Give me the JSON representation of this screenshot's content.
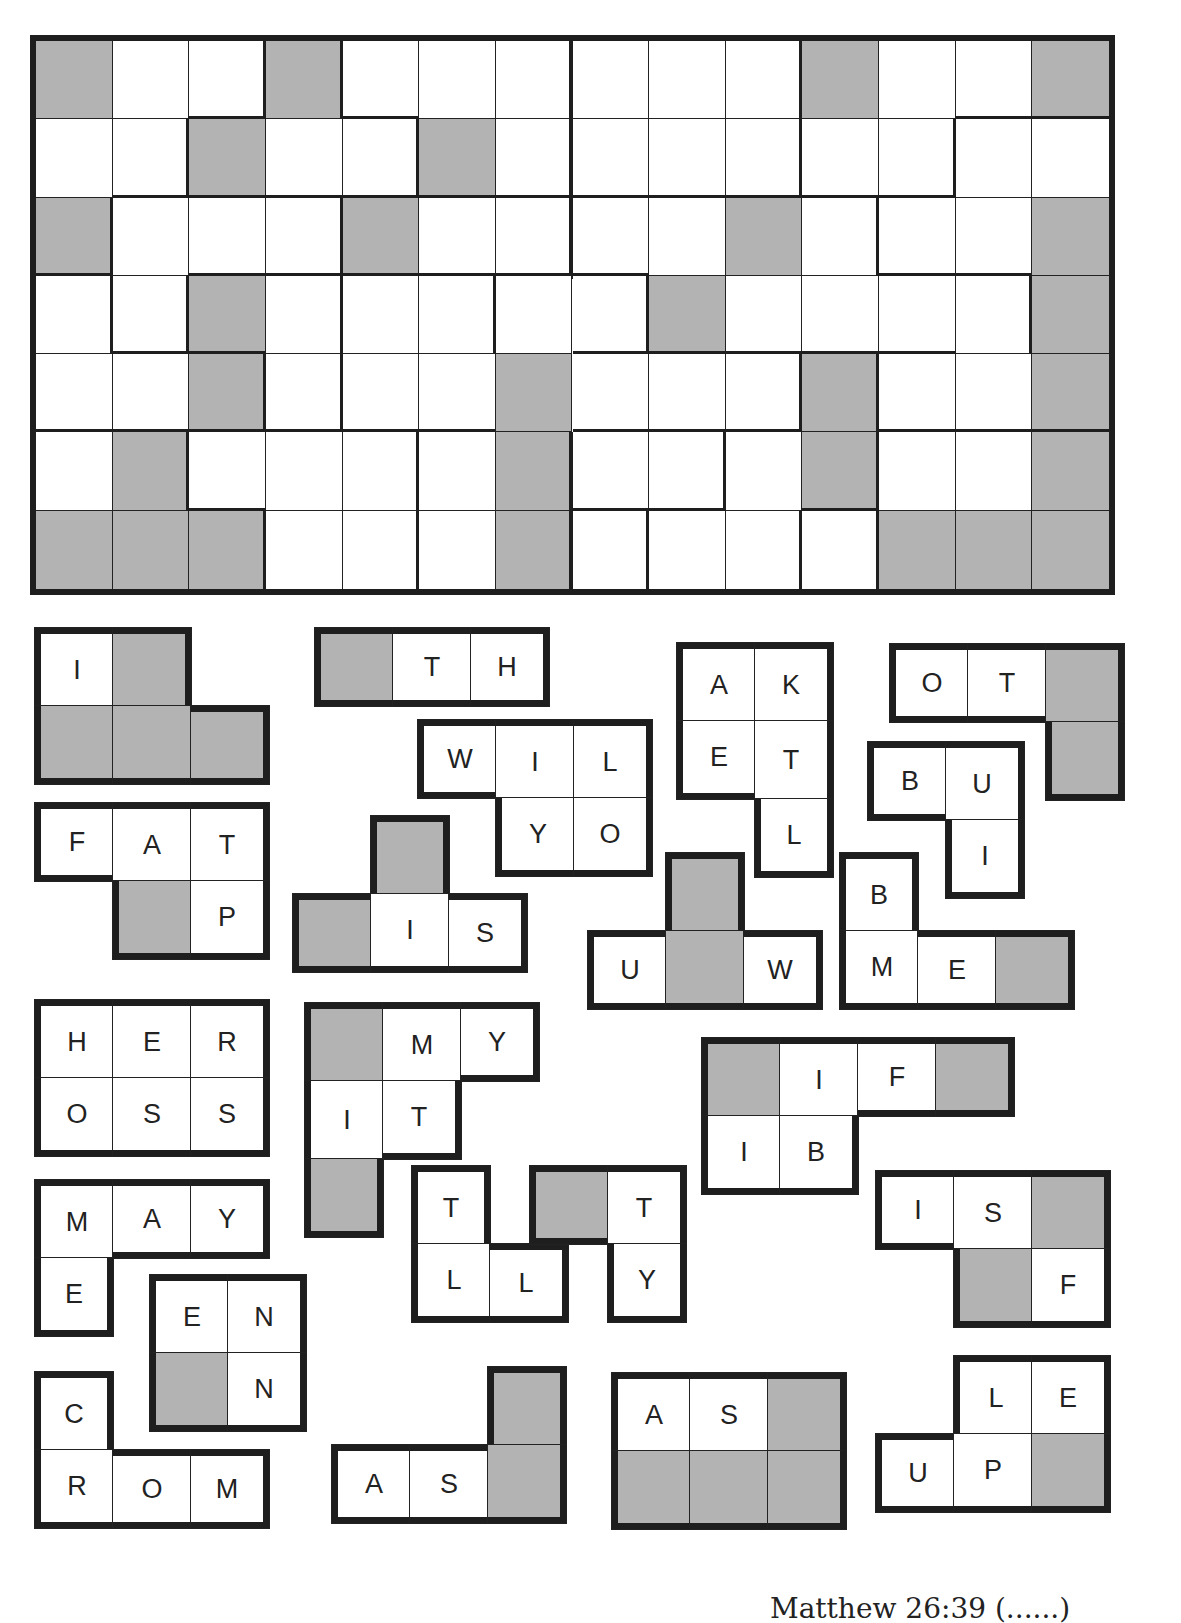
{
  "puzzle": {
    "type": "framed-pieces",
    "grid": {
      "rows": 7,
      "cols": 14,
      "shaded": [
        [
          0,
          0
        ],
        [
          0,
          3
        ],
        [
          0,
          10
        ],
        [
          0,
          13
        ],
        [
          1,
          2
        ],
        [
          1,
          5
        ],
        [
          2,
          0
        ],
        [
          2,
          4
        ],
        [
          2,
          9
        ],
        [
          2,
          13
        ],
        [
          3,
          2
        ],
        [
          3,
          8
        ],
        [
          3,
          13
        ],
        [
          4,
          2
        ],
        [
          4,
          6
        ],
        [
          4,
          10
        ],
        [
          4,
          13
        ],
        [
          5,
          1
        ],
        [
          5,
          6
        ],
        [
          5,
          10
        ],
        [
          5,
          13
        ],
        [
          6,
          0
        ],
        [
          6,
          1
        ],
        [
          6,
          2
        ],
        [
          6,
          6
        ],
        [
          6,
          11
        ],
        [
          6,
          12
        ],
        [
          6,
          13
        ]
      ],
      "thick_right": [
        [
          0,
          2
        ],
        [
          0,
          3
        ],
        [
          0,
          6
        ],
        [
          0,
          9
        ],
        [
          1,
          1
        ],
        [
          1,
          4
        ],
        [
          1,
          6
        ],
        [
          1,
          9
        ],
        [
          1,
          11
        ],
        [
          2,
          0
        ],
        [
          2,
          3
        ],
        [
          2,
          6
        ],
        [
          2,
          10
        ],
        [
          3,
          0
        ],
        [
          3,
          1
        ],
        [
          3,
          3
        ],
        [
          3,
          5
        ],
        [
          3,
          7
        ],
        [
          3,
          12
        ],
        [
          4,
          2
        ],
        [
          4,
          3
        ],
        [
          4,
          9
        ],
        [
          4,
          10
        ],
        [
          5,
          1
        ],
        [
          5,
          4
        ],
        [
          5,
          6
        ],
        [
          5,
          8
        ],
        [
          5,
          10
        ],
        [
          6,
          2
        ],
        [
          6,
          4
        ],
        [
          6,
          6
        ],
        [
          6,
          7
        ],
        [
          6,
          9
        ],
        [
          6,
          10
        ]
      ],
      "thick_bottom": [
        [
          0,
          2
        ],
        [
          0,
          4
        ],
        [
          0,
          12
        ],
        [
          0,
          13
        ],
        [
          1,
          1
        ],
        [
          1,
          2
        ],
        [
          1,
          3
        ],
        [
          1,
          4
        ],
        [
          1,
          5
        ],
        [
          1,
          6
        ],
        [
          1,
          7
        ],
        [
          1,
          8
        ],
        [
          1,
          9
        ],
        [
          1,
          10
        ],
        [
          1,
          11
        ],
        [
          2,
          0
        ],
        [
          2,
          2
        ],
        [
          2,
          3
        ],
        [
          2,
          4
        ],
        [
          2,
          5
        ],
        [
          2,
          6
        ],
        [
          2,
          7
        ],
        [
          2,
          11
        ],
        [
          2,
          12
        ],
        [
          3,
          1
        ],
        [
          3,
          2
        ],
        [
          3,
          7
        ],
        [
          3,
          8
        ],
        [
          3,
          9
        ],
        [
          3,
          10
        ],
        [
          3,
          11
        ],
        [
          4,
          0
        ],
        [
          4,
          1
        ],
        [
          4,
          2
        ],
        [
          4,
          3
        ],
        [
          4,
          4
        ],
        [
          4,
          5
        ],
        [
          4,
          7
        ],
        [
          4,
          8
        ],
        [
          4,
          9
        ],
        [
          4,
          11
        ],
        [
          4,
          12
        ],
        [
          4,
          13
        ],
        [
          5,
          2
        ],
        [
          5,
          7
        ],
        [
          5,
          8
        ],
        [
          5,
          10
        ]
      ]
    },
    "pieces": [
      {
        "id": "p1",
        "x": 35,
        "y": 628,
        "cells": [
          {
            "r": 0,
            "c": 0,
            "l": "I"
          },
          {
            "r": 0,
            "c": 1,
            "l": ""
          },
          {
            "r": 1,
            "c": 0,
            "l": ""
          },
          {
            "r": 1,
            "c": 1,
            "l": ""
          },
          {
            "r": 1,
            "c": 2,
            "l": ""
          }
        ]
      },
      {
        "id": "p2",
        "x": 315,
        "y": 628,
        "cells": [
          {
            "r": 0,
            "c": 0,
            "l": ""
          },
          {
            "r": 0,
            "c": 1,
            "l": "T"
          },
          {
            "r": 0,
            "c": 2,
            "l": "H"
          }
        ]
      },
      {
        "id": "p3",
        "x": 677,
        "y": 643,
        "cells": [
          {
            "r": 0,
            "c": 0,
            "l": "A"
          },
          {
            "r": 0,
            "c": 1,
            "l": "K"
          },
          {
            "r": 1,
            "c": 0,
            "l": "E"
          },
          {
            "r": 1,
            "c": 1,
            "l": "T"
          },
          {
            "r": 2,
            "c": 1,
            "l": "L"
          }
        ]
      },
      {
        "id": "p4",
        "x": 890,
        "y": 644,
        "cells": [
          {
            "r": 0,
            "c": 0,
            "l": "O"
          },
          {
            "r": 0,
            "c": 1,
            "l": "T"
          },
          {
            "r": 0,
            "c": 2,
            "l": ""
          },
          {
            "r": 1,
            "c": 2,
            "l": ""
          }
        ]
      },
      {
        "id": "p5",
        "x": 418,
        "y": 720,
        "cells": [
          {
            "r": 0,
            "c": 0,
            "l": "W"
          },
          {
            "r": 0,
            "c": 1,
            "l": "I"
          },
          {
            "r": 0,
            "c": 2,
            "l": "L"
          },
          {
            "r": 1,
            "c": 1,
            "l": "Y"
          },
          {
            "r": 1,
            "c": 2,
            "l": "O"
          }
        ]
      },
      {
        "id": "p6",
        "x": 868,
        "y": 742,
        "cells": [
          {
            "r": 0,
            "c": 0,
            "l": "B"
          },
          {
            "r": 0,
            "c": 1,
            "l": "U"
          },
          {
            "r": 1,
            "c": 1,
            "l": "I"
          }
        ]
      },
      {
        "id": "p7",
        "x": 35,
        "y": 803,
        "cells": [
          {
            "r": 0,
            "c": 0,
            "l": "F"
          },
          {
            "r": 0,
            "c": 1,
            "l": "A"
          },
          {
            "r": 0,
            "c": 2,
            "l": "T"
          },
          {
            "r": 1,
            "c": 1,
            "l": ""
          },
          {
            "r": 1,
            "c": 2,
            "l": "P"
          }
        ]
      },
      {
        "id": "p8",
        "x": 293,
        "y": 816,
        "cells": [
          {
            "r": 0,
            "c": 1,
            "l": ""
          },
          {
            "r": 1,
            "c": 0,
            "l": ""
          },
          {
            "r": 1,
            "c": 1,
            "l": "I"
          },
          {
            "r": 1,
            "c": 2,
            "l": "S"
          }
        ]
      },
      {
        "id": "p9",
        "x": 588,
        "y": 853,
        "cells": [
          {
            "r": 0,
            "c": 1,
            "l": ""
          },
          {
            "r": 1,
            "c": 0,
            "l": "U"
          },
          {
            "r": 1,
            "c": 1,
            "l": ""
          },
          {
            "r": 1,
            "c": 2,
            "l": "W"
          }
        ]
      },
      {
        "id": "p10",
        "x": 840,
        "y": 853,
        "cells": [
          {
            "r": 0,
            "c": 0,
            "l": "B"
          },
          {
            "r": 1,
            "c": 0,
            "l": "M"
          },
          {
            "r": 1,
            "c": 1,
            "l": "E"
          },
          {
            "r": 1,
            "c": 2,
            "l": ""
          }
        ]
      },
      {
        "id": "p11",
        "x": 35,
        "y": 1000,
        "cells": [
          {
            "r": 0,
            "c": 0,
            "l": "H"
          },
          {
            "r": 0,
            "c": 1,
            "l": "E"
          },
          {
            "r": 0,
            "c": 2,
            "l": "R"
          },
          {
            "r": 1,
            "c": 0,
            "l": "O"
          },
          {
            "r": 1,
            "c": 1,
            "l": "S"
          },
          {
            "r": 1,
            "c": 2,
            "l": "S"
          }
        ]
      },
      {
        "id": "p12",
        "x": 305,
        "y": 1003,
        "cells": [
          {
            "r": 0,
            "c": 0,
            "l": ""
          },
          {
            "r": 0,
            "c": 1,
            "l": "M"
          },
          {
            "r": 0,
            "c": 2,
            "l": "Y"
          },
          {
            "r": 1,
            "c": 0,
            "l": "I"
          },
          {
            "r": 1,
            "c": 1,
            "l": "T"
          },
          {
            "r": 2,
            "c": 0,
            "l": ""
          }
        ]
      },
      {
        "id": "p13",
        "x": 702,
        "y": 1038,
        "cells": [
          {
            "r": 0,
            "c": 0,
            "l": ""
          },
          {
            "r": 0,
            "c": 1,
            "l": "I"
          },
          {
            "r": 0,
            "c": 2,
            "l": "F"
          },
          {
            "r": 0,
            "c": 3,
            "l": ""
          },
          {
            "r": 1,
            "c": 0,
            "l": "I"
          },
          {
            "r": 1,
            "c": 1,
            "l": "B"
          }
        ]
      },
      {
        "id": "p14",
        "x": 35,
        "y": 1180,
        "cells": [
          {
            "r": 0,
            "c": 0,
            "l": "M"
          },
          {
            "r": 0,
            "c": 1,
            "l": "A"
          },
          {
            "r": 0,
            "c": 2,
            "l": "Y"
          },
          {
            "r": 1,
            "c": 0,
            "l": "E"
          }
        ]
      },
      {
        "id": "p15",
        "x": 412,
        "y": 1166,
        "cells": [
          {
            "r": 0,
            "c": 0,
            "l": "T"
          },
          {
            "r": 1,
            "c": 0,
            "l": "L"
          },
          {
            "r": 1,
            "c": 1,
            "l": "L"
          }
        ]
      },
      {
        "id": "p16",
        "x": 530,
        "y": 1166,
        "cells": [
          {
            "r": 0,
            "c": 0,
            "l": ""
          },
          {
            "r": 0,
            "c": 1,
            "l": "T"
          },
          {
            "r": 1,
            "c": 1,
            "l": "Y"
          }
        ]
      },
      {
        "id": "p17",
        "x": 876,
        "y": 1171,
        "cells": [
          {
            "r": 0,
            "c": 0,
            "l": "I"
          },
          {
            "r": 0,
            "c": 1,
            "l": "S"
          },
          {
            "r": 0,
            "c": 2,
            "l": ""
          },
          {
            "r": 1,
            "c": 1,
            "l": ""
          },
          {
            "r": 1,
            "c": 2,
            "l": "F"
          }
        ]
      },
      {
        "id": "p18",
        "x": 150,
        "y": 1275,
        "cells": [
          {
            "r": 0,
            "c": 0,
            "l": "E"
          },
          {
            "r": 0,
            "c": 1,
            "l": "N"
          },
          {
            "r": 1,
            "c": 0,
            "l": ""
          },
          {
            "r": 1,
            "c": 1,
            "l": "N"
          }
        ]
      },
      {
        "id": "p19",
        "x": 35,
        "y": 1372,
        "cells": [
          {
            "r": 0,
            "c": 0,
            "l": "C"
          },
          {
            "r": 1,
            "c": 0,
            "l": "R"
          },
          {
            "r": 1,
            "c": 1,
            "l": "O"
          },
          {
            "r": 1,
            "c": 2,
            "l": "M"
          }
        ]
      },
      {
        "id": "p20",
        "x": 332,
        "y": 1367,
        "cells": [
          {
            "r": 0,
            "c": 2,
            "l": ""
          },
          {
            "r": 1,
            "c": 0,
            "l": "A"
          },
          {
            "r": 1,
            "c": 1,
            "l": "S"
          },
          {
            "r": 1,
            "c": 2,
            "l": ""
          }
        ]
      },
      {
        "id": "p21",
        "x": 612,
        "y": 1373,
        "cells": [
          {
            "r": 0,
            "c": 0,
            "l": "A"
          },
          {
            "r": 0,
            "c": 1,
            "l": "S"
          },
          {
            "r": 0,
            "c": 2,
            "l": ""
          },
          {
            "r": 1,
            "c": 0,
            "l": ""
          },
          {
            "r": 1,
            "c": 1,
            "l": ""
          },
          {
            "r": 1,
            "c": 2,
            "l": ""
          }
        ]
      },
      {
        "id": "p22",
        "x": 876,
        "y": 1356,
        "cells": [
          {
            "r": 0,
            "c": 1,
            "l": "L"
          },
          {
            "r": 0,
            "c": 2,
            "l": "E"
          },
          {
            "r": 1,
            "c": 0,
            "l": "U"
          },
          {
            "r": 1,
            "c": 1,
            "l": "P"
          },
          {
            "r": 1,
            "c": 2,
            "l": ""
          }
        ]
      }
    ]
  },
  "footer": {
    "citation": "Matthew 26:39 (......)"
  },
  "colors": {
    "shaded": "#b3b3b3",
    "border": "#1e1e1e",
    "background": "#ffffff"
  }
}
